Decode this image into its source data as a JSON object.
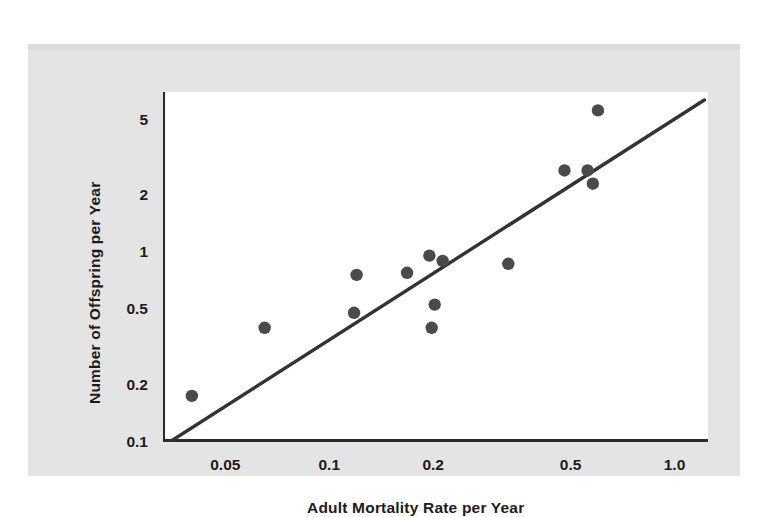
{
  "figure": {
    "background_color": "#e4e4e4",
    "plot_background_color": "#ffffff",
    "ink_color": "#2b2b2b",
    "point_color": "#4a4a4a",
    "line_color": "#333333"
  },
  "chart_data": {
    "type": "scatter",
    "title": "",
    "xlabel": "Adult Mortality Rate per Year",
    "ylabel": "Number of Offspring per Year",
    "xscale": "log",
    "yscale": "log",
    "xlim": [
      0.033,
      1.25
    ],
    "ylim": [
      0.1,
      7.0
    ],
    "grid": false,
    "legend": false,
    "xticks": [
      0.05,
      0.1,
      0.2,
      0.5,
      1.0
    ],
    "xtick_labels": [
      "0.05",
      "0.1",
      "0.2",
      "0.5",
      "1.0"
    ],
    "yticks": [
      0.1,
      0.2,
      0.5,
      1,
      2,
      5
    ],
    "ytick_labels": [
      "0.1",
      "0.2",
      "0.5",
      "1",
      "2",
      "5"
    ],
    "points": [
      {
        "x": 0.04,
        "y": 0.175
      },
      {
        "x": 0.065,
        "y": 0.4
      },
      {
        "x": 0.118,
        "y": 0.48
      },
      {
        "x": 0.12,
        "y": 0.76
      },
      {
        "x": 0.168,
        "y": 0.78
      },
      {
        "x": 0.195,
        "y": 0.96
      },
      {
        "x": 0.198,
        "y": 0.4
      },
      {
        "x": 0.202,
        "y": 0.53
      },
      {
        "x": 0.213,
        "y": 0.9
      },
      {
        "x": 0.33,
        "y": 0.87
      },
      {
        "x": 0.48,
        "y": 2.7
      },
      {
        "x": 0.56,
        "y": 2.7
      },
      {
        "x": 0.58,
        "y": 2.3
      },
      {
        "x": 0.6,
        "y": 5.6
      }
    ],
    "trend_line": {
      "label": "",
      "x_start": 0.0345,
      "y_start": 0.1,
      "x_end": 1.22,
      "y_end": 6.35
    }
  }
}
